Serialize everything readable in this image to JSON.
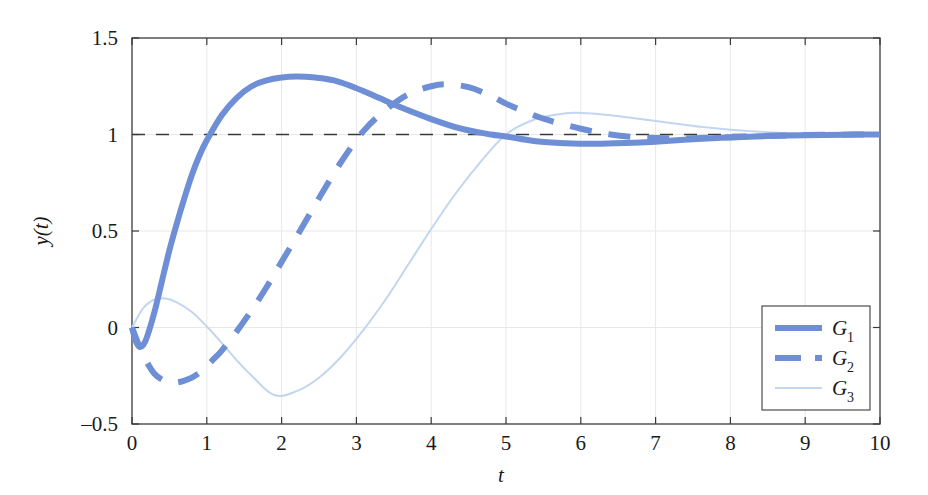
{
  "chart_data": {
    "type": "line",
    "title": "",
    "xlabel": "t",
    "ylabel": "y(t)",
    "xlim": [
      0,
      10
    ],
    "ylim": [
      -0.5,
      1.5
    ],
    "xticks": [
      "0",
      "1",
      "2",
      "3",
      "4",
      "5",
      "6",
      "7",
      "8",
      "9",
      "10"
    ],
    "yticks": [
      "-0.5",
      "0",
      "0.5",
      "1",
      "1.5"
    ],
    "grid": true,
    "grid_style": "faint vertical and horizontal gridlines at ticks",
    "legend_position": "lower right",
    "reference_line": {
      "y": 1,
      "style": "dashed",
      "color": "#3a3a3a"
    },
    "series": [
      {
        "name": "G_1",
        "legend_label": "G",
        "legend_sub": "1",
        "style": "solid",
        "width": 6,
        "color": "#6e8fd6",
        "description": "fast response with small initial undershoot, overshoot to 1.29 at t=2.45, settles to 1",
        "x": [
          0,
          0.05,
          0.1,
          0.15,
          0.2,
          0.3,
          0.4,
          0.5,
          0.6,
          0.7,
          0.8,
          0.9,
          1.0,
          1.2,
          1.4,
          1.6,
          1.8,
          2.0,
          2.2,
          2.45,
          2.7,
          3.0,
          3.3,
          3.6,
          4.0,
          4.4,
          4.8,
          5.0,
          5.4,
          5.8,
          6.2,
          6.6,
          7.0,
          7.5,
          8.0,
          8.5,
          9.0,
          9.5,
          10.0
        ],
        "y": [
          0,
          -0.07,
          -0.1,
          -0.09,
          -0.05,
          0.08,
          0.24,
          0.4,
          0.54,
          0.67,
          0.79,
          0.89,
          0.97,
          1.1,
          1.19,
          1.25,
          1.28,
          1.295,
          1.3,
          1.295,
          1.28,
          1.24,
          1.19,
          1.14,
          1.08,
          1.03,
          1.0,
          0.99,
          0.965,
          0.955,
          0.952,
          0.956,
          0.963,
          0.975,
          0.985,
          0.992,
          0.996,
          0.999,
          1.0
        ]
      },
      {
        "name": "G_2",
        "legend_label": "G",
        "legend_sub": "2",
        "style": "dashed",
        "width": 6,
        "color": "#6e8fd6",
        "description": "slower response with large initial undershoot to -0.28 near t=0.6, overshoot to 1.26 at t=4.2, settles to 1",
        "x": [
          0,
          0.1,
          0.2,
          0.3,
          0.4,
          0.5,
          0.6,
          0.7,
          0.8,
          0.9,
          1.0,
          1.1,
          1.2,
          1.4,
          1.6,
          1.8,
          2.0,
          2.2,
          2.5,
          2.8,
          3.1,
          3.4,
          3.7,
          4.0,
          4.2,
          4.5,
          4.8,
          5.0,
          5.3,
          5.6,
          6.0,
          6.4,
          6.8,
          7.2,
          7.6,
          8.0,
          8.5,
          9.0,
          9.5,
          10.0
        ],
        "y": [
          0,
          -0.1,
          -0.18,
          -0.24,
          -0.27,
          -0.285,
          -0.285,
          -0.275,
          -0.26,
          -0.235,
          -0.2,
          -0.16,
          -0.12,
          -0.02,
          0.09,
          0.21,
          0.34,
          0.47,
          0.67,
          0.86,
          1.02,
          1.13,
          1.21,
          1.25,
          1.26,
          1.245,
          1.2,
          1.16,
          1.11,
          1.07,
          1.03,
          1.0,
          0.985,
          0.98,
          0.982,
          0.986,
          0.993,
          0.997,
          0.999,
          1.0
        ]
      },
      {
        "name": "G_3",
        "legend_label": "G",
        "legend_sub": "3",
        "style": "solid",
        "width": 2,
        "color": "#c3d6f0",
        "description": "initial rise to 0.15 at t=0.45, undershoot to -0.35 at t=1.9, rise crossing 1 at t=5, overshoot to 1.11 at t=6, settles to 1",
        "x": [
          0,
          0.15,
          0.3,
          0.45,
          0.6,
          0.8,
          1.0,
          1.2,
          1.4,
          1.6,
          1.9,
          2.2,
          2.5,
          2.8,
          3.1,
          3.4,
          3.7,
          4.0,
          4.3,
          4.6,
          5.0,
          5.4,
          5.8,
          6.0,
          6.4,
          6.8,
          7.2,
          7.6,
          8.0,
          8.5,
          9.0,
          9.5,
          10.0
        ],
        "y": [
          0,
          0.1,
          0.145,
          0.15,
          0.13,
          0.08,
          0.005,
          -0.08,
          -0.17,
          -0.25,
          -0.35,
          -0.33,
          -0.26,
          -0.15,
          -0.01,
          0.15,
          0.33,
          0.51,
          0.68,
          0.83,
          1.0,
          1.08,
          1.11,
          1.112,
          1.1,
          1.08,
          1.06,
          1.04,
          1.025,
          1.012,
          1.005,
          1.001,
          1.0
        ]
      }
    ]
  },
  "axis": {
    "x_tick_labels": [
      "0",
      "1",
      "2",
      "3",
      "4",
      "5",
      "6",
      "7",
      "8",
      "9",
      "10"
    ],
    "y_tick_labels": [
      "1.5",
      "1",
      "0.5",
      "0",
      "-0.5"
    ],
    "x_title": "t",
    "y_title": "y(t)"
  },
  "legend": {
    "entries": [
      {
        "label": "G",
        "sub": "1"
      },
      {
        "label": "G",
        "sub": "2"
      },
      {
        "label": "G",
        "sub": "3"
      }
    ]
  },
  "colors": {
    "series_main": "#6e8fd6",
    "series_light": "#c3d6f0",
    "axis": "#3a3a3a",
    "grid": "#e8e8e8",
    "reference": "#3a3a3a",
    "background": "#ffffff"
  }
}
